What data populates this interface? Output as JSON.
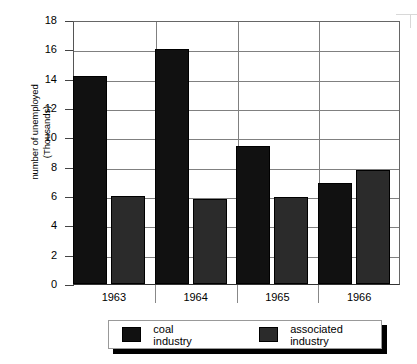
{
  "chart_data": {
    "type": "bar",
    "title": "",
    "xlabel": "",
    "ylabel": "number of unemployed (Thousands)",
    "ylabel_line1": "number of unemployed",
    "ylabel_line2": "(Thousands)",
    "categories": [
      "1963",
      "1964",
      "1965",
      "1966"
    ],
    "ylim": [
      0,
      18
    ],
    "ytick_step": 2,
    "yticks": [
      "18",
      "16",
      "14",
      "12",
      "10",
      "8",
      "6",
      "4",
      "2",
      "0"
    ],
    "grid": true,
    "legend_position": "bottom",
    "series": [
      {
        "name": "coal industry",
        "color": "#111111",
        "values": [
          14.2,
          16.0,
          9.4,
          6.9
        ]
      },
      {
        "name": "associated industry",
        "color": "#2b2b2b",
        "values": [
          6.0,
          5.8,
          5.9,
          7.8
        ]
      }
    ]
  },
  "legend": {
    "items": [
      {
        "label": "coal industry"
      },
      {
        "label": "associated industry"
      }
    ]
  }
}
